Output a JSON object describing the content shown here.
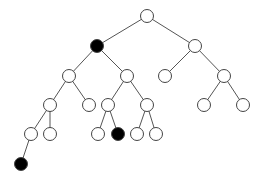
{
  "diagram": {
    "type": "binary-tree",
    "width": 259,
    "height": 180,
    "node_radius": 6.5,
    "colors": {
      "background": "#ffffff",
      "edge": "#555555",
      "node_stroke": "#444444",
      "node_fill_empty": "#ffffff",
      "node_fill_marked": "#000000"
    },
    "nodes": [
      {
        "id": "n0",
        "x": 147,
        "y": 16,
        "marked": false
      },
      {
        "id": "n1",
        "x": 97,
        "y": 46,
        "marked": true
      },
      {
        "id": "n2",
        "x": 195,
        "y": 46,
        "marked": false
      },
      {
        "id": "n3",
        "x": 69,
        "y": 76,
        "marked": false
      },
      {
        "id": "n4",
        "x": 127,
        "y": 76,
        "marked": false
      },
      {
        "id": "n5",
        "x": 165,
        "y": 76,
        "marked": false
      },
      {
        "id": "n6",
        "x": 224,
        "y": 76,
        "marked": false
      },
      {
        "id": "n7",
        "x": 50,
        "y": 105,
        "marked": false
      },
      {
        "id": "n8",
        "x": 89,
        "y": 105,
        "marked": false
      },
      {
        "id": "n9",
        "x": 108,
        "y": 105,
        "marked": false
      },
      {
        "id": "n10",
        "x": 147,
        "y": 105,
        "marked": false
      },
      {
        "id": "n11",
        "x": 204,
        "y": 105,
        "marked": false
      },
      {
        "id": "n12",
        "x": 243,
        "y": 105,
        "marked": false
      },
      {
        "id": "n13",
        "x": 31,
        "y": 134,
        "marked": false
      },
      {
        "id": "n14",
        "x": 50,
        "y": 134,
        "marked": false
      },
      {
        "id": "n15",
        "x": 98,
        "y": 134,
        "marked": false
      },
      {
        "id": "n16",
        "x": 118,
        "y": 134,
        "marked": true
      },
      {
        "id": "n17",
        "x": 137,
        "y": 134,
        "marked": false
      },
      {
        "id": "n18",
        "x": 156,
        "y": 134,
        "marked": false
      },
      {
        "id": "n19",
        "x": 21,
        "y": 164,
        "marked": true
      }
    ],
    "edges": [
      [
        "n0",
        "n1"
      ],
      [
        "n0",
        "n2"
      ],
      [
        "n1",
        "n3"
      ],
      [
        "n1",
        "n4"
      ],
      [
        "n2",
        "n5"
      ],
      [
        "n2",
        "n6"
      ],
      [
        "n3",
        "n7"
      ],
      [
        "n3",
        "n8"
      ],
      [
        "n4",
        "n9"
      ],
      [
        "n4",
        "n10"
      ],
      [
        "n6",
        "n11"
      ],
      [
        "n6",
        "n12"
      ],
      [
        "n7",
        "n13"
      ],
      [
        "n7",
        "n14"
      ],
      [
        "n9",
        "n15"
      ],
      [
        "n9",
        "n16"
      ],
      [
        "n10",
        "n17"
      ],
      [
        "n10",
        "n18"
      ],
      [
        "n13",
        "n19"
      ]
    ]
  }
}
